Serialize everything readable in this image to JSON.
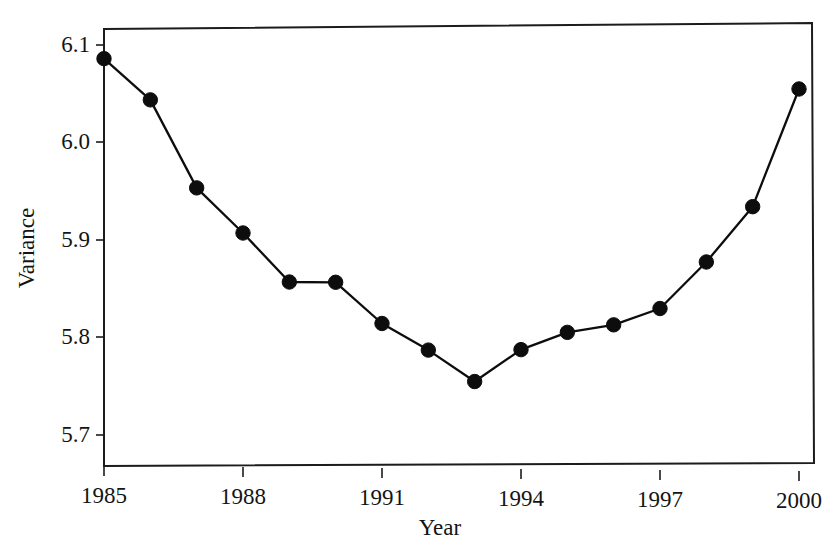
{
  "chart_data": {
    "type": "line",
    "title": "",
    "xlabel": "Year",
    "ylabel": "Variance",
    "xlim": [
      1984.6,
      2000.4
    ],
    "ylim": [
      5.66,
      6.115
    ],
    "grid": false,
    "legend": null,
    "marker": "filled-circle",
    "x": [
      1985,
      1986,
      1987,
      1988,
      1989,
      1990,
      1991,
      1992,
      1993,
      1994,
      1995,
      1996,
      1997,
      1998,
      1999,
      2000
    ],
    "xtick_labels": [
      "1985",
      "1988",
      "1991",
      "1994",
      "1997",
      "2000"
    ],
    "xticks": [
      1985,
      1988,
      1991,
      1994,
      1997,
      2000
    ],
    "ytick_labels": [
      "6.1",
      "6.0",
      "5.9",
      "5.8",
      "5.7"
    ],
    "yticks": [
      6.1,
      6.0,
      5.9,
      5.8,
      5.7
    ],
    "series": [
      {
        "name": "Variance",
        "values": [
          6.086,
          6.044,
          5.954,
          5.908,
          5.858,
          5.858,
          5.816,
          5.789,
          5.757,
          5.79,
          5.808,
          5.816,
          5.833,
          5.881,
          5.938,
          6.059
        ]
      }
    ]
  },
  "figure": {
    "background_color": "#ffffff",
    "line_color": "#0d0d0d",
    "text_color": "#141414"
  }
}
